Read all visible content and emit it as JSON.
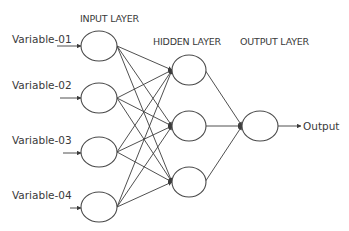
{
  "diagram": {
    "type": "neural-network",
    "layers": [
      {
        "id": "input",
        "label": "INPUT LAYER",
        "nodes": 4
      },
      {
        "id": "hidden",
        "label": "HIDDEN LAYER",
        "nodes": 3
      },
      {
        "id": "output",
        "label": "OUTPUT LAYER",
        "nodes": 1
      }
    ],
    "inputs": [
      {
        "label": "Variable-01"
      },
      {
        "label": "Variable-02"
      },
      {
        "label": "Variable-03"
      },
      {
        "label": "Variable-04"
      }
    ],
    "output_label": "Output",
    "connections": "fully-connected",
    "colors": {
      "line": "#3c3c3c",
      "text": "#3a3a3a",
      "background": "#ffffff"
    }
  }
}
